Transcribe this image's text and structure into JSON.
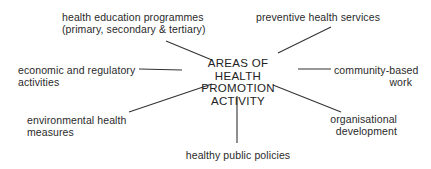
{
  "diagram": {
    "center": {
      "line1": "AREAS OF",
      "line2": "HEALTH PROMOTION",
      "line3": "ACTIVITY"
    },
    "nodes": {
      "health_education": {
        "line1": "health education programmes",
        "line2": "(primary, secondary & tertiary)"
      },
      "preventive_health": {
        "line1": "preventive health services"
      },
      "economic_regulatory": {
        "line1": "economic and regulatory",
        "line2": "activities"
      },
      "community_based": {
        "line1": "community-based",
        "line2": "work"
      },
      "environmental_health": {
        "line1": "environmental health",
        "line2": "measures"
      },
      "organisational_development": {
        "line1": "organisational",
        "line2": "development"
      },
      "healthy_public_policies": {
        "line1": "healthy public policies"
      }
    }
  }
}
